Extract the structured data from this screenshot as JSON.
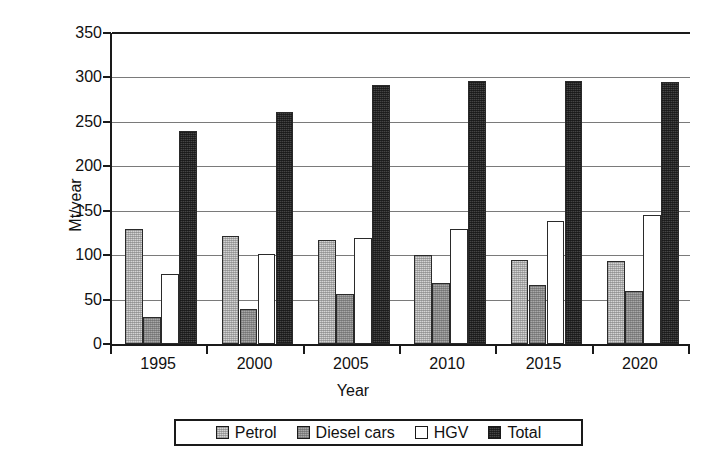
{
  "chart_data": {
    "type": "bar",
    "title": "",
    "xlabel": "Year",
    "ylabel": "Mt/year",
    "categories": [
      "1995",
      "2000",
      "2005",
      "2010",
      "2015",
      "2020"
    ],
    "series": [
      {
        "name": "Petrol",
        "values": [
          130,
          122,
          117,
          100,
          95,
          93
        ],
        "color": "#d4d4d4"
      },
      {
        "name": "Diesel cars",
        "values": [
          30,
          39,
          56,
          69,
          66,
          60
        ],
        "color": "#a8a8a8"
      },
      {
        "name": "HGV",
        "values": [
          79,
          101,
          119,
          129,
          138,
          145
        ],
        "color": "#ffffff"
      },
      {
        "name": "Total",
        "values": [
          240,
          261,
          291,
          296,
          296,
          295
        ],
        "color": "#454545"
      }
    ],
    "ylim": [
      0,
      350
    ],
    "yticks": [
      0,
      50,
      100,
      150,
      200,
      250,
      300,
      350
    ],
    "ytick_labels": [
      "0",
      "50",
      "100",
      "150",
      "200",
      "250",
      "300",
      "350"
    ],
    "grid": true,
    "grid_axis": "y",
    "legend_position": "bottom-center"
  },
  "axes": {
    "y_title": "Mt/year",
    "x_title": "Year"
  },
  "legend": {
    "entries": [
      "Petrol",
      "Diesel cars",
      "HGV",
      "Total"
    ]
  }
}
